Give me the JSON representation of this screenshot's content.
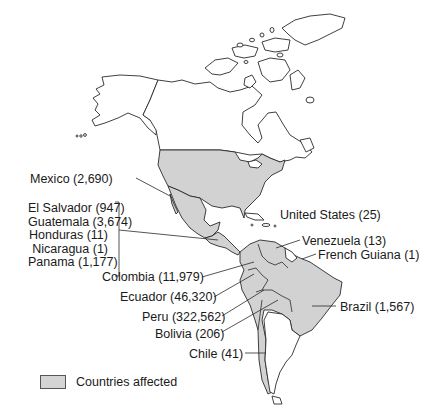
{
  "map": {
    "region": "Americas",
    "fill_affected": "#d2d2d2",
    "fill_unaffected": "#ffffff",
    "stroke": "#2a2a2a"
  },
  "labels": {
    "mexico": "Mexico (2,690)",
    "united_states": "United States (25)",
    "central_america": [
      "El Salvador (947)",
      "Guatemala (3,674)",
      "Honduras (11)",
      "Nicaragua (1)",
      "Panama (1,177)"
    ],
    "venezuela": "Venezuela (13)",
    "french_guiana": "French Guiana (1)",
    "colombia": "Colombia (11,979)",
    "ecuador": "Ecuador (46,320)",
    "peru": "Peru (322,562)",
    "bolivia": "Bolivia (206)",
    "brazil": "Brazil (1,567)",
    "chile": "Chile (41)"
  },
  "countries": [
    {
      "name": "Mexico",
      "count": 2690
    },
    {
      "name": "United States",
      "count": 25
    },
    {
      "name": "El Salvador",
      "count": 947
    },
    {
      "name": "Guatemala",
      "count": 3674
    },
    {
      "name": "Honduras",
      "count": 11
    },
    {
      "name": "Nicaragua",
      "count": 1
    },
    {
      "name": "Panama",
      "count": 1177
    },
    {
      "name": "Venezuela",
      "count": 13
    },
    {
      "name": "French Guiana",
      "count": 1
    },
    {
      "name": "Colombia",
      "count": 11979
    },
    {
      "name": "Ecuador",
      "count": 46320
    },
    {
      "name": "Peru",
      "count": 322562
    },
    {
      "name": "Bolivia",
      "count": 206
    },
    {
      "name": "Brazil",
      "count": 1567
    },
    {
      "name": "Chile",
      "count": 41
    }
  ],
  "legend": {
    "label": "Countries affected",
    "swatch_color": "#d2d2d2"
  }
}
